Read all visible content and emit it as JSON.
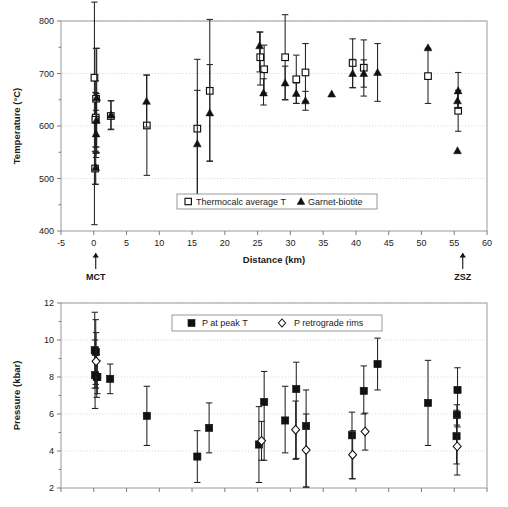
{
  "figure": {
    "header_faint_text": "",
    "panels": [
      "temperature",
      "pressure"
    ]
  },
  "chart_data": [
    {
      "id": "temperature",
      "type": "scatter",
      "title": "",
      "xlabel": "Distance (km)",
      "ylabel": "Temperature (°C)",
      "xlim": [
        -5,
        60
      ],
      "ylim": [
        400,
        800
      ],
      "xticks": [
        -5,
        0,
        5,
        10,
        15,
        20,
        25,
        30,
        35,
        40,
        45,
        50,
        55,
        60
      ],
      "xticklabels": [
        "-5",
        "0",
        "5",
        "10",
        "15",
        "20",
        "25",
        "30",
        "35",
        "40",
        "45",
        "50",
        "55",
        "60"
      ],
      "yticks": [
        400,
        500,
        600,
        700,
        800
      ],
      "yticklabels": [
        "400",
        "500",
        "600",
        "700",
        "800"
      ],
      "grid": "horizontal-dotted",
      "legend_position": "bottom-center",
      "annotations": [
        {
          "label": "MCT",
          "x": 0.3,
          "marker": "up-arrow"
        },
        {
          "label": "ZSZ",
          "x": 56.3,
          "marker": "up-arrow"
        }
      ],
      "series": [
        {
          "name": "Thermocalc average T",
          "marker": "open-square",
          "points": [
            {
              "x": 0.1,
              "y": 692,
              "ylow": 412,
              "yhigh": 836
            },
            {
              "x": 0.35,
              "y": 652,
              "ylow": 549,
              "yhigh": 748
            },
            {
              "x": 0.3,
              "y": 616,
              "ylow": 548,
              "yhigh": 686
            },
            {
              "x": 0.25,
              "y": 612,
              "ylow": 560,
              "yhigh": 664
            },
            {
              "x": 0.2,
              "y": 519,
              "ylow": 489,
              "yhigh": 551
            },
            {
              "x": 2.6,
              "y": 619,
              "ylow": 593,
              "yhigh": 648
            },
            {
              "x": 8.1,
              "y": 601,
              "ylow": 506,
              "yhigh": 697
            },
            {
              "x": 15.8,
              "y": 595,
              "ylow": 466,
              "yhigh": 727
            },
            {
              "x": 17.7,
              "y": 667,
              "ylow": 533,
              "yhigh": 803
            },
            {
              "x": 25.4,
              "y": 731,
              "ylow": 678,
              "yhigh": 779
            },
            {
              "x": 26.0,
              "y": 708,
              "ylow": 663,
              "yhigh": 754
            },
            {
              "x": 29.2,
              "y": 731,
              "ylow": 650,
              "yhigh": 812
            },
            {
              "x": 30.9,
              "y": 689,
              "ylow": 643,
              "yhigh": 735
            },
            {
              "x": 32.3,
              "y": 702,
              "ylow": 647,
              "yhigh": 757
            },
            {
              "x": 39.5,
              "y": 720,
              "ylow": 673,
              "yhigh": 766
            },
            {
              "x": 41.2,
              "y": 711,
              "ylow": 657,
              "yhigh": 764
            },
            {
              "x": 51.0,
              "y": 695,
              "ylow": 643,
              "yhigh": 748
            },
            {
              "x": 55.6,
              "y": 629,
              "ylow": 590,
              "yhigh": 668
            }
          ]
        },
        {
          "name": "Garnet-biotite",
          "marker": "filled-triangle",
          "points": [
            {
              "x": 0.45,
              "y": 654,
              "ylow": 549,
              "yhigh": 748
            },
            {
              "x": 0.4,
              "y": 611,
              "ylow": 560,
              "yhigh": 662
            },
            {
              "x": 0.35,
              "y": 585,
              "ylow": 540,
              "yhigh": 630
            },
            {
              "x": 0.3,
              "y": 521,
              "ylow": 489,
              "yhigh": 552
            },
            {
              "x": 2.65,
              "y": 621,
              "ylow": 594,
              "yhigh": 648
            },
            {
              "x": 8.05,
              "y": 647,
              "ylow": 598,
              "yhigh": 697
            },
            {
              "x": 15.8,
              "y": 566,
              "ylow": 466,
              "yhigh": 668
            },
            {
              "x": 17.7,
              "y": 625,
              "ylow": 533,
              "yhigh": 717
            },
            {
              "x": 25.3,
              "y": 753,
              "ylow": 703,
              "yhigh": 779
            },
            {
              "x": 25.9,
              "y": 663,
              "ylow": 640,
              "yhigh": 690
            },
            {
              "x": 29.2,
              "y": 682,
              "ylow": 650,
              "yhigh": 714
            },
            {
              "x": 30.9,
              "y": 662,
              "ylow": 643,
              "yhigh": 682
            },
            {
              "x": 32.3,
              "y": 648,
              "ylow": 630,
              "yhigh": 666
            },
            {
              "x": 36.3,
              "y": 661,
              "ylow": 661,
              "yhigh": 661
            },
            {
              "x": 39.5,
              "y": 700,
              "ylow": 673,
              "yhigh": 727
            },
            {
              "x": 41.2,
              "y": 700,
              "ylow": 674,
              "yhigh": 726
            },
            {
              "x": 43.3,
              "y": 702,
              "ylow": 647,
              "yhigh": 757
            },
            {
              "x": 51.0,
              "y": 749,
              "ylow": 749,
              "yhigh": 749
            },
            {
              "x": 55.6,
              "y": 667,
              "ylow": 634,
              "yhigh": 702
            },
            {
              "x": 55.5,
              "y": 648,
              "ylow": 634,
              "yhigh": 662
            },
            {
              "x": 55.5,
              "y": 553,
              "ylow": 553,
              "yhigh": 553
            }
          ]
        }
      ]
    },
    {
      "id": "pressure",
      "type": "scatter",
      "title": "",
      "xlabel": "",
      "ylabel": "Pressure (kbar)",
      "xlim": [
        -5,
        60
      ],
      "ylim": [
        2,
        12
      ],
      "xticks": [
        -5,
        0,
        5,
        10,
        15,
        20,
        25,
        30,
        35,
        40,
        45,
        50,
        55,
        60
      ],
      "xticklabels": [
        "",
        "",
        "",
        "",
        "",
        "",
        "",
        "",
        "",
        "",
        "",
        "",
        "",
        ""
      ],
      "yticks": [
        2,
        4,
        6,
        8,
        10,
        12
      ],
      "yticklabels": [
        "2",
        "4",
        "6",
        "8",
        "10",
        "12"
      ],
      "grid": "horizontal-dotted",
      "legend_position": "top-center",
      "series": [
        {
          "name": "P at peak T",
          "marker": "filled-square",
          "points": [
            {
              "x": 0.15,
              "y": 9.45,
              "ylow": 7.4,
              "yhigh": 11.5
            },
            {
              "x": 0.3,
              "y": 9.35,
              "ylow": 7.6,
              "yhigh": 11.1
            },
            {
              "x": 0.2,
              "y": 8.1,
              "ylow": 6.3,
              "yhigh": 10.0
            },
            {
              "x": 0.45,
              "y": 8.0,
              "ylow": 6.9,
              "yhigh": 9.2
            },
            {
              "x": 0.55,
              "y": 8.0,
              "ylow": 7.1,
              "yhigh": 8.9
            },
            {
              "x": 2.5,
              "y": 7.9,
              "ylow": 7.1,
              "yhigh": 8.7
            },
            {
              "x": 8.1,
              "y": 5.9,
              "ylow": 4.3,
              "yhigh": 7.5
            },
            {
              "x": 15.8,
              "y": 3.7,
              "ylow": 2.3,
              "yhigh": 5.1
            },
            {
              "x": 17.6,
              "y": 5.25,
              "ylow": 3.9,
              "yhigh": 6.6
            },
            {
              "x": 25.2,
              "y": 4.35,
              "ylow": 2.3,
              "yhigh": 6.4
            },
            {
              "x": 26.0,
              "y": 6.65,
              "ylow": 3.5,
              "yhigh": 8.3
            },
            {
              "x": 29.2,
              "y": 5.65,
              "ylow": 3.9,
              "yhigh": 7.5
            },
            {
              "x": 30.9,
              "y": 7.35,
              "ylow": 3.6,
              "yhigh": 8.8
            },
            {
              "x": 32.4,
              "y": 5.35,
              "ylow": 2.05,
              "yhigh": 7.3
            },
            {
              "x": 39.4,
              "y": 4.85,
              "ylow": 2.5,
              "yhigh": 6.1
            },
            {
              "x": 41.2,
              "y": 7.25,
              "ylow": 6.0,
              "yhigh": 8.6
            },
            {
              "x": 43.3,
              "y": 8.7,
              "ylow": 7.3,
              "yhigh": 10.1
            },
            {
              "x": 51.0,
              "y": 6.6,
              "ylow": 4.3,
              "yhigh": 8.9
            },
            {
              "x": 55.5,
              "y": 7.3,
              "ylow": 5.3,
              "yhigh": 8.5
            },
            {
              "x": 55.4,
              "y": 5.95,
              "ylow": 5.4,
              "yhigh": 6.5
            },
            {
              "x": 55.35,
              "y": 4.8,
              "ylow": 3.3,
              "yhigh": 6.2
            }
          ]
        },
        {
          "name": "P retrograde rims",
          "marker": "open-diamond",
          "points": [
            {
              "x": 0.35,
              "y": 8.85,
              "ylow": 7.4,
              "yhigh": 10.4
            },
            {
              "x": 25.6,
              "y": 4.55,
              "ylow": 3.5,
              "yhigh": 5.6
            },
            {
              "x": 30.8,
              "y": 5.15,
              "ylow": 3.55,
              "yhigh": 6.7
            },
            {
              "x": 32.4,
              "y": 4.05,
              "ylow": 2.05,
              "yhigh": 6.0
            },
            {
              "x": 39.5,
              "y": 3.8,
              "ylow": 2.5,
              "yhigh": 5.1
            },
            {
              "x": 41.4,
              "y": 5.05,
              "ylow": 4.05,
              "yhigh": 6.05
            },
            {
              "x": 55.45,
              "y": 4.25,
              "ylow": 2.7,
              "yhigh": 5.8
            }
          ]
        }
      ]
    }
  ]
}
